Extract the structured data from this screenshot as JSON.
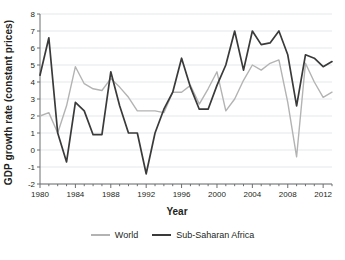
{
  "chart_data": {
    "type": "line",
    "title": "",
    "xlabel": "Year",
    "ylabel": "GDP growth rate (constant prices)",
    "xlim": [
      1980,
      2013
    ],
    "ylim": [
      -2,
      8
    ],
    "xticks": [
      1980,
      1984,
      1988,
      1992,
      1996,
      2000,
      2004,
      2008,
      2012
    ],
    "xtick_labels": [
      "1980",
      "1984",
      "1988",
      "1992",
      "1996",
      "2000",
      "2004",
      "2008",
      "2012"
    ],
    "xminor_step": 1,
    "yticks": [
      -2,
      -1,
      0,
      1,
      2,
      3,
      4,
      5,
      6,
      7,
      8
    ],
    "ytick_labels": [
      "-2",
      "-1",
      "0",
      "1",
      "2",
      "3",
      "4",
      "5",
      "6",
      "7",
      "8"
    ],
    "grid": "horizontal",
    "grid_color": "#d9dde3",
    "legend_position": "bottom",
    "x": [
      1980,
      1981,
      1982,
      1983,
      1984,
      1985,
      1986,
      1987,
      1988,
      1989,
      1990,
      1991,
      1992,
      1993,
      1994,
      1995,
      1996,
      1997,
      1998,
      1999,
      2000,
      2001,
      2002,
      2003,
      2004,
      2005,
      2006,
      2007,
      2008,
      2009,
      2010,
      2011,
      2012,
      2013
    ],
    "series": [
      {
        "name": "World",
        "color": "#b3b3b3",
        "values": [
          2.0,
          2.2,
          1.0,
          2.6,
          4.9,
          3.9,
          3.6,
          3.5,
          4.2,
          3.7,
          3.1,
          2.3,
          2.3,
          2.3,
          2.2,
          3.4,
          3.4,
          3.8,
          2.7,
          3.6,
          4.6,
          2.3,
          3.0,
          4.1,
          5.0,
          4.7,
          5.1,
          5.3,
          2.8,
          -0.4,
          5.1,
          4.0,
          3.1,
          3.4
        ]
      },
      {
        "name": "Sub-Saharan Africa",
        "color": "#3a3a3a",
        "values": [
          4.4,
          6.6,
          1.0,
          -0.7,
          2.8,
          2.3,
          0.9,
          0.9,
          4.6,
          2.6,
          1.0,
          1.0,
          -1.4,
          1.0,
          2.4,
          3.4,
          5.4,
          3.7,
          2.4,
          2.4,
          3.8,
          5.0,
          7.0,
          4.7,
          7.0,
          6.2,
          6.3,
          7.0,
          5.6,
          2.6,
          5.6,
          5.4,
          4.9,
          5.2
        ]
      }
    ]
  },
  "legend": {
    "items": [
      {
        "label": "World"
      },
      {
        "label": "Sub-Saharan Africa"
      }
    ]
  },
  "axis": {
    "x_title": "Year",
    "y_title": "GDP growth rate (constant prices)"
  }
}
